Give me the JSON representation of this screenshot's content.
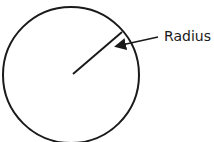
{
  "diagram": {
    "label": "Radius",
    "stroke_color": "#1a1a1a",
    "circle": {
      "cx": 71,
      "cy": 75,
      "r": 68
    },
    "radius_line": {
      "x1": 73,
      "y1": 74,
      "x2": 122,
      "y2": 32
    },
    "arrow": {
      "x1": 158,
      "y1": 37,
      "x2": 115,
      "y2": 46
    }
  }
}
